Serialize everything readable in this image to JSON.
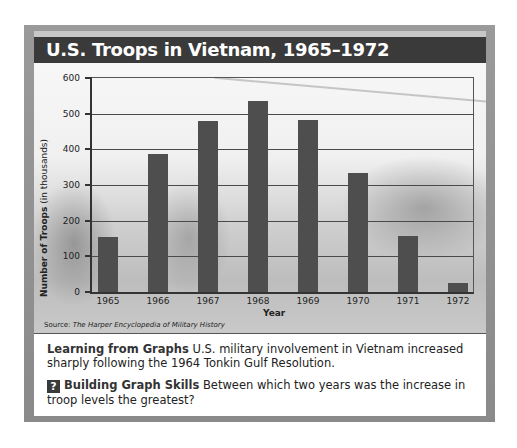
{
  "chart_data": {
    "type": "bar",
    "title": "U.S. Troops in Vietnam, 1965–1972",
    "xlabel": "Year",
    "ylabel": "Number of Troops (in thousands)",
    "ylabel_bold": "Number of Troops",
    "ylabel_normal": " (in thousands)",
    "categories": [
      "1965",
      "1966",
      "1967",
      "1968",
      "1969",
      "1970",
      "1971",
      "1972"
    ],
    "values": [
      155,
      387,
      480,
      535,
      483,
      335,
      158,
      26
    ],
    "yticks": [
      0,
      100,
      200,
      300,
      400,
      500,
      600
    ],
    "ylim": [
      0,
      600
    ],
    "grid": true,
    "legend": null,
    "source_label": "Source: ",
    "source_title": "The Harper Encyclopedia of Military History"
  },
  "text": {
    "learning_heading": "Learning from Graphs",
    "learning_body": " U.S. military involvement in Vietnam increased sharply following the 1964 Tonkin Gulf Resolution.",
    "skills_icon": "?",
    "skills_heading": "Building Graph Skills",
    "skills_body": " Between which two years was the increase in troop levels the greatest?"
  },
  "colors": {
    "title_bar": "#3a3a3a",
    "bar": "#4e4e4e",
    "frame": "#8f8f8f"
  }
}
